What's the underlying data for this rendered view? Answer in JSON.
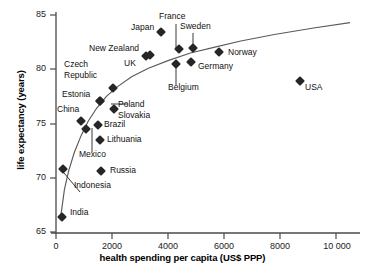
{
  "chart_data": {
    "type": "scatter",
    "title": "",
    "xlabel": "health spending per capita (US$ PPP)",
    "ylabel": "life expectancy (years)",
    "xlim": [
      0,
      10700
    ],
    "ylim": [
      65,
      85.6
    ],
    "xticks": [
      0,
      2000,
      4000,
      6000,
      8000,
      10000
    ],
    "xticklabels": [
      "0",
      "2000",
      "4000",
      "6000",
      "8000",
      "10 000"
    ],
    "yticks": [
      65,
      70,
      75,
      80,
      85
    ],
    "yticklabels": [
      "65",
      "70",
      "75",
      "80",
      "85"
    ],
    "grid": false,
    "legend": false,
    "marker_shape": "filled-diamond",
    "marker_color": "#262626",
    "trend_line": {
      "present": true,
      "description": "logarithmic best-fit curve rising steeply at low spending and flattening above 4000",
      "color": "#555555",
      "points": [
        [
          180,
          66.6
        ],
        [
          300,
          68.9
        ],
        [
          450,
          70.6
        ],
        [
          650,
          72.3
        ],
        [
          900,
          73.9
        ],
        [
          1150,
          75.2
        ],
        [
          1450,
          76.4
        ],
        [
          1800,
          77.5
        ],
        [
          2200,
          78.4
        ],
        [
          2700,
          79.3
        ],
        [
          3300,
          80.1
        ],
        [
          4000,
          80.8
        ],
        [
          4800,
          81.5
        ],
        [
          5600,
          82.0
        ],
        [
          6600,
          82.6
        ],
        [
          7800,
          83.2
        ],
        [
          9200,
          83.8
        ],
        [
          10500,
          84.3
        ]
      ]
    },
    "points": [
      {
        "label": "India",
        "x": 215,
        "y": 66.4
      },
      {
        "label": "Indonesia",
        "x": 245,
        "y": 70.8
      },
      {
        "label": "Russia",
        "x": 1610,
        "y": 70.6
      },
      {
        "label": "Lithuania",
        "x": 1580,
        "y": 73.5
      },
      {
        "label": "Mexico",
        "x": 1070,
        "y": 74.5
      },
      {
        "label": "China",
        "x": 880,
        "y": 75.2
      },
      {
        "label": "Brazil",
        "x": 1500,
        "y": 74.9
      },
      {
        "label": "Slovakia",
        "x": 2060,
        "y": 76.3
      },
      {
        "label": "Poland",
        "x": 1560,
        "y": 77.1
      },
      {
        "label": "Estonia",
        "x": 1560,
        "y": 77.1
      },
      {
        "label": "Czech Republic",
        "x": 2030,
        "y": 78.3
      },
      {
        "label": "USA",
        "x": 8700,
        "y": 78.9
      },
      {
        "label": "Belgium",
        "x": 4280,
        "y": 80.5
      },
      {
        "label": "Germany",
        "x": 4830,
        "y": 80.7
      },
      {
        "label": "UK",
        "x": 3230,
        "y": 81.2
      },
      {
        "label": "New Zealand",
        "x": 3340,
        "y": 81.3
      },
      {
        "label": "Norway",
        "x": 5830,
        "y": 81.6
      },
      {
        "label": "France",
        "x": 4380,
        "y": 81.9
      },
      {
        "label": "Sweden",
        "x": 4880,
        "y": 82.0
      },
      {
        "label": "Japan",
        "x": 3740,
        "y": 83.4
      }
    ]
  },
  "axes": {
    "x_title": "health spending per capita (US$ PPP)",
    "y_title": "life expectancy (years)",
    "x_ticks": [
      {
        "label": "0"
      },
      {
        "label": "2000"
      },
      {
        "label": "4000"
      },
      {
        "label": "6000"
      },
      {
        "label": "8000"
      },
      {
        "label": "10 000"
      }
    ],
    "y_ticks": [
      {
        "label": "85"
      },
      {
        "label": "80"
      },
      {
        "label": "75"
      },
      {
        "label": "70"
      },
      {
        "label": "65"
      }
    ]
  },
  "labels": {
    "japan": "Japan",
    "france": "France",
    "sweden": "Sweden",
    "new_zealand": "New Zealand",
    "uk": "UK",
    "norway": "Norway",
    "germany": "Germany",
    "czech": "Czech",
    "republic": "Republic",
    "belgium": "Belgium",
    "usa": "USA",
    "estonia": "Estonia",
    "poland": "Poland",
    "china": "China",
    "slovakia": "Slovakia",
    "brazil": "Brazil",
    "lithuania": "Lithuania",
    "mexico": "Mexico",
    "russia": "Russia",
    "indonesia": "Indonesia",
    "india": "India"
  }
}
